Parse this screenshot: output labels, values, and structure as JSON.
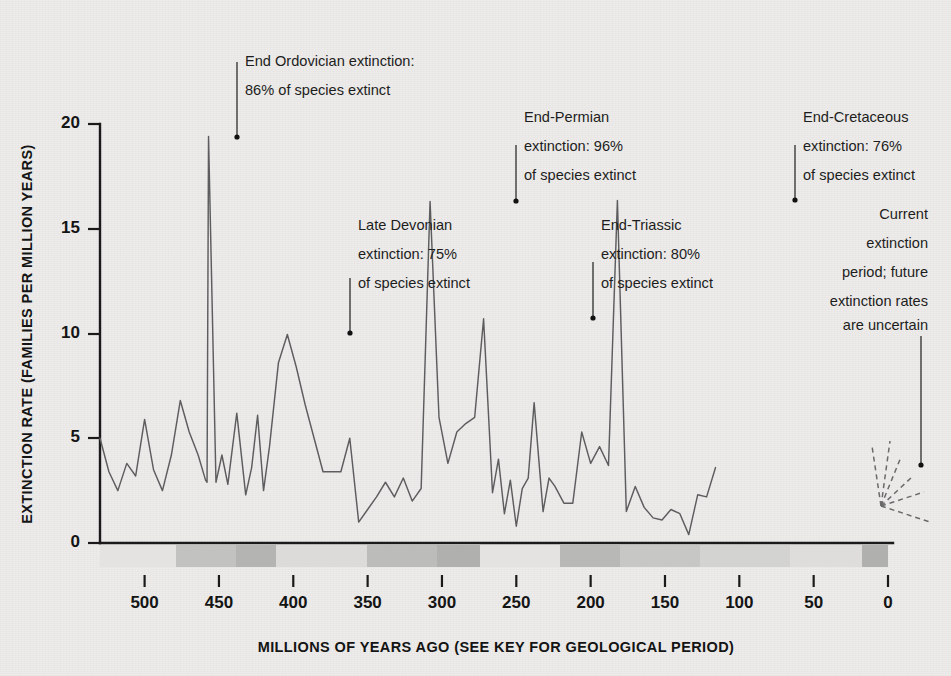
{
  "chart_data": {
    "type": "line",
    "title": "",
    "xlabel": "MILLIONS OF YEARS AGO (SEE KEY FOR GEOLOGICAL PERIOD)",
    "ylabel": "EXTINCTION RATE (FAMILIES PER MILLION YEARS)",
    "xlim": [
      530,
      -20
    ],
    "ylim": [
      0,
      21
    ],
    "x_ticks": [
      500,
      450,
      400,
      350,
      300,
      250,
      200,
      150,
      100,
      50,
      0
    ],
    "y_ticks": [
      0,
      5,
      10,
      15,
      20
    ],
    "grid": false,
    "legend": "none",
    "x_axis_direction": "reversed",
    "series": [
      {
        "name": "Extinction rate",
        "style": "solid",
        "color": "#5d5d60",
        "points": [
          [
            530,
            5.0
          ],
          [
            524,
            3.4
          ],
          [
            518,
            2.5
          ],
          [
            512,
            3.8
          ],
          [
            506,
            3.2
          ],
          [
            500,
            5.9
          ],
          [
            494,
            3.5
          ],
          [
            488,
            2.5
          ],
          [
            482,
            4.2
          ],
          [
            476,
            6.8
          ],
          [
            470,
            5.3
          ],
          [
            464,
            4.2
          ],
          [
            459,
            3.0
          ],
          [
            458,
            2.9
          ],
          [
            457,
            19.4
          ],
          [
            452,
            2.9
          ],
          [
            448,
            4.2
          ],
          [
            444,
            2.8
          ],
          [
            438,
            6.2
          ],
          [
            432,
            2.3
          ],
          [
            428,
            3.6
          ],
          [
            424,
            6.1
          ],
          [
            420,
            2.5
          ],
          [
            416,
            4.6
          ],
          [
            410,
            8.6
          ],
          [
            404,
            9.95
          ],
          [
            398,
            8.4
          ],
          [
            392,
            6.6
          ],
          [
            386,
            5.0
          ],
          [
            380,
            3.4
          ],
          [
            374,
            3.4
          ],
          [
            368,
            3.4
          ],
          [
            362,
            5.0
          ],
          [
            356,
            1.0
          ],
          [
            350,
            1.6
          ],
          [
            344,
            2.2
          ],
          [
            338,
            2.9
          ],
          [
            332,
            2.2
          ],
          [
            326,
            3.1
          ],
          [
            320,
            2.0
          ],
          [
            314,
            2.6
          ],
          [
            308,
            16.3
          ],
          [
            302,
            6.0
          ],
          [
            296,
            3.8
          ],
          [
            290,
            5.3
          ],
          [
            284,
            5.7
          ],
          [
            278,
            6.0
          ],
          [
            272,
            10.7
          ],
          [
            266,
            2.4
          ],
          [
            262,
            4.0
          ],
          [
            258,
            1.4
          ],
          [
            254,
            3.0
          ],
          [
            250,
            0.8
          ],
          [
            246,
            2.6
          ],
          [
            242,
            3.1
          ],
          [
            238,
            6.7
          ],
          [
            232,
            1.5
          ],
          [
            228,
            3.1
          ],
          [
            224,
            2.7
          ],
          [
            218,
            1.9
          ],
          [
            212,
            1.9
          ],
          [
            206,
            5.3
          ],
          [
            200,
            3.8
          ],
          [
            194,
            4.6
          ],
          [
            188,
            3.7
          ],
          [
            182,
            16.35
          ],
          [
            176,
            1.5
          ],
          [
            170,
            2.7
          ],
          [
            164,
            1.7
          ],
          [
            158,
            1.2
          ],
          [
            152,
            1.1
          ],
          [
            146,
            1.6
          ],
          [
            140,
            1.4
          ],
          [
            134,
            0.4
          ],
          [
            128,
            2.3
          ],
          [
            122,
            2.2
          ],
          [
            116,
            3.6
          ]
        ],
        "note": "points listed as [x_pixel_domain_index, value]; x values are schematic sample positions across 530-0 Ma"
      },
      {
        "name": "Future uncertainty fan",
        "style": "dashed",
        "color": "#6a6a6c",
        "branch_count": 5
      }
    ],
    "annotations": [
      {
        "id": "end-ordovician",
        "lines": [
          "End  Ordovician extinction:",
          "86% of species extinct"
        ],
        "value": 19.4,
        "age_ma": 444,
        "align": "left"
      },
      {
        "id": "late-devonian",
        "lines": [
          "Late Devonian",
          "extinction: 75%",
          "of species extinct"
        ],
        "value": 9.95,
        "age_ma": 365,
        "align": "left"
      },
      {
        "id": "end-permian",
        "lines": [
          "End-Permian",
          "extinction: 96%",
          "of species extinct"
        ],
        "value": 16.3,
        "age_ma": 251,
        "align": "left"
      },
      {
        "id": "end-triassic",
        "lines": [
          "End-Triassic",
          "extinction: 80%",
          "of species extinct"
        ],
        "value": 10.7,
        "age_ma": 201,
        "align": "left"
      },
      {
        "id": "end-cretaceous",
        "lines": [
          "End-Cretaceous",
          "extinction: 76%",
          "of species extinct"
        ],
        "value": 16.35,
        "age_ma": 66,
        "align": "left"
      },
      {
        "id": "current-period",
        "lines": [
          "Current",
          "extinction",
          "period; future",
          "extinction rates",
          "are uncertain"
        ],
        "value": 3.7,
        "age_ma": -12,
        "align": "right"
      }
    ],
    "geologic_bands": [
      {
        "x0": 100,
        "x1": 176,
        "color": "#e4e3e1"
      },
      {
        "x0": 176,
        "x1": 236,
        "color": "#c2c2c1"
      },
      {
        "x0": 236,
        "x1": 276,
        "color": "#b4b4b3"
      },
      {
        "x0": 276,
        "x1": 367,
        "color": "#dcdbd9"
      },
      {
        "x0": 367,
        "x1": 437,
        "color": "#bcbcbb"
      },
      {
        "x0": 437,
        "x1": 480,
        "color": "#b0b0af"
      },
      {
        "x0": 480,
        "x1": 560,
        "color": "#e4e3e1"
      },
      {
        "x0": 560,
        "x1": 620,
        "color": "#b8b8b7"
      },
      {
        "x0": 620,
        "x1": 700,
        "color": "#c7c7c6"
      },
      {
        "x0": 700,
        "x1": 790,
        "color": "#d3d3d1"
      },
      {
        "x0": 790,
        "x1": 862,
        "color": "#dedddb"
      },
      {
        "x0": 862,
        "x1": 888,
        "color": "#b0b0af"
      }
    ],
    "colors": {
      "background": "#edecea",
      "axis": "#1a1a1a",
      "series": "#5d5d60",
      "text": "#1d1d1d"
    }
  },
  "annotation_labels": {
    "ordovician_l1": "End  Ordovician extinction:",
    "ordovician_l2": "86% of species extinct",
    "devonian_l1": "Late Devonian",
    "devonian_l2": "extinction: 75%",
    "devonian_l3": "of species extinct",
    "permian_l1": "End-Permian",
    "permian_l2": "extinction: 96%",
    "permian_l3": "of species extinct",
    "triassic_l1": "End-Triassic",
    "triassic_l2": "extinction: 80%",
    "triassic_l3": "of species extinct",
    "cretaceous_l1": "End-Cretaceous",
    "cretaceous_l2": "extinction: 76%",
    "cretaceous_l3": "of species extinct",
    "current_l1": "Current",
    "current_l2": "extinction",
    "current_l3": "period; future",
    "current_l4": "extinction rates",
    "current_l5": "are uncertain"
  },
  "axes": {
    "y_title": "EXTINCTION RATE (FAMILIES PER MILLION YEARS)",
    "x_title": "MILLIONS OF YEARS AGO (SEE KEY FOR GEOLOGICAL PERIOD)",
    "y_0": "0",
    "y_5": "5",
    "y_10": "10",
    "y_15": "15",
    "y_20": "20",
    "x_500": "500",
    "x_450": "450",
    "x_400": "400",
    "x_350": "350",
    "x_300": "300",
    "x_250": "250",
    "x_200": "200",
    "x_150": "150",
    "x_100": "100",
    "x_50": "50",
    "x_0": "0"
  }
}
